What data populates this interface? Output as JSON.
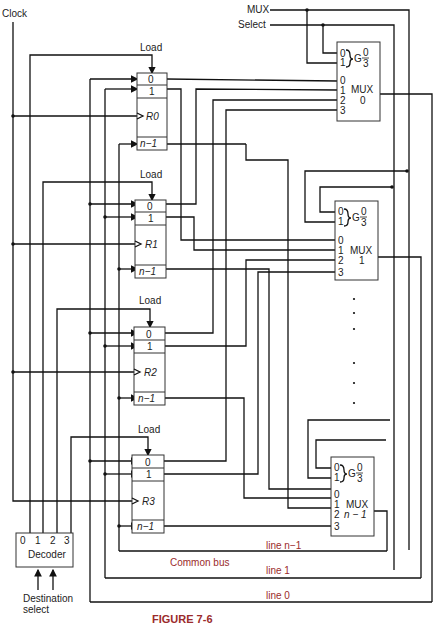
{
  "figure": {
    "caption": "FIGURE 7-6",
    "colors": {
      "wire": "#111111",
      "bus_label": "#9b2b2b",
      "background": "#ffffff"
    }
  },
  "inputs": {
    "clock": "Clock",
    "mux_select_line1": "MUX",
    "mux_select_line2": "Select",
    "destination_select_line1": "Destination",
    "destination_select_line2": "select"
  },
  "registers": [
    {
      "name": "R0",
      "load": "Load",
      "bits": [
        "0",
        "1",
        "n−1"
      ]
    },
    {
      "name": "R1",
      "load": "Load",
      "bits": [
        "0",
        "1",
        "n−1"
      ]
    },
    {
      "name": "R2",
      "load": "Load",
      "bits": [
        "0",
        "1",
        "n−1"
      ]
    },
    {
      "name": "R3",
      "load": "Load",
      "bits": [
        "0",
        "1",
        "n−1"
      ]
    }
  ],
  "multiplexers": [
    {
      "label": "MUX",
      "index": "0",
      "select_inputs": [
        "0",
        "1"
      ],
      "g_label": "G",
      "g_range_top": "0",
      "g_range_bottom": "3",
      "data_inputs": [
        "0",
        "1",
        "2",
        "3"
      ]
    },
    {
      "label": "MUX",
      "index": "1",
      "select_inputs": [
        "0",
        "1"
      ],
      "g_label": "G",
      "g_range_top": "0",
      "g_range_bottom": "3",
      "data_inputs": [
        "0",
        "1",
        "2",
        "3"
      ]
    },
    {
      "label": "MUX",
      "index": "n − 1",
      "select_inputs": [
        "0",
        "1"
      ],
      "g_label": "G",
      "g_range_top": "0",
      "g_range_bottom": "3",
      "data_inputs": [
        "0",
        "1",
        "2",
        "3"
      ]
    }
  ],
  "decoder": {
    "label": "Decoder",
    "outputs": [
      "0",
      "1",
      "2",
      "3"
    ]
  },
  "bus": {
    "title": "Common bus",
    "lines": [
      "line n−1",
      "line 1",
      "line 0"
    ]
  },
  "ellipsis": "⋮"
}
